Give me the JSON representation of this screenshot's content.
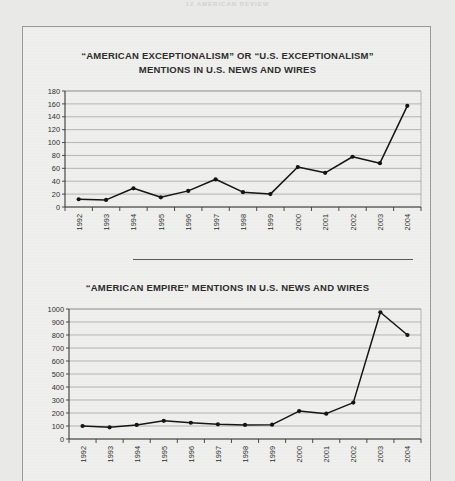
{
  "page": {
    "scan_header": "12     AMERICAN REVIEW",
    "background_color": "#e9e9e7",
    "paper_color": "#efefed",
    "ink_color": "#161616"
  },
  "charts": [
    {
      "title_line1": "“AMERICAN EXCEPTIONALISM” OR “U.S. EXCEPTIONALISM”",
      "title_line2": "MENTIONS IN U.S.  NEWS AND WIRES",
      "chart_data": {
        "type": "line",
        "title": "“AMERICAN EXCEPTIONALISM” OR “U.S. EXCEPTIONALISM” MENTIONS IN U.S.  NEWS AND WIRES",
        "xlabel": "",
        "ylabel": "",
        "ylim": [
          0,
          180
        ],
        "ytick_step": 20,
        "yticks": [
          0,
          20,
          40,
          60,
          80,
          100,
          120,
          140,
          160,
          180
        ],
        "grid": true,
        "legend": false,
        "categories": [
          "1992",
          "1993",
          "1994",
          "1995",
          "1996",
          "1997",
          "1998",
          "1999",
          "2000",
          "2001",
          "2002",
          "2003",
          "2004"
        ],
        "values": [
          12,
          11,
          29,
          15,
          25,
          43,
          23,
          20,
          62,
          53,
          78,
          68,
          157
        ]
      }
    },
    {
      "title_line1": "“AMERICAN EMPIRE”  MENTIONS IN U.S. NEWS AND WIRES",
      "title_line2": "",
      "chart_data": {
        "type": "line",
        "title": "“AMERICAN EMPIRE”  MENTIONS IN U.S. NEWS AND WIRES",
        "xlabel": "",
        "ylabel": "",
        "ylim": [
          0,
          1000
        ],
        "ytick_step": 100,
        "yticks": [
          0,
          100,
          200,
          300,
          400,
          500,
          600,
          700,
          800,
          900,
          1000
        ],
        "grid": true,
        "legend": false,
        "categories": [
          "1992",
          "1993",
          "1994",
          "1995",
          "1996",
          "1997",
          "1998",
          "1999",
          "2000",
          "2001",
          "2002",
          "2003",
          "2004"
        ],
        "values": [
          100,
          90,
          108,
          140,
          125,
          113,
          108,
          110,
          215,
          195,
          280,
          975,
          800
        ]
      }
    }
  ]
}
